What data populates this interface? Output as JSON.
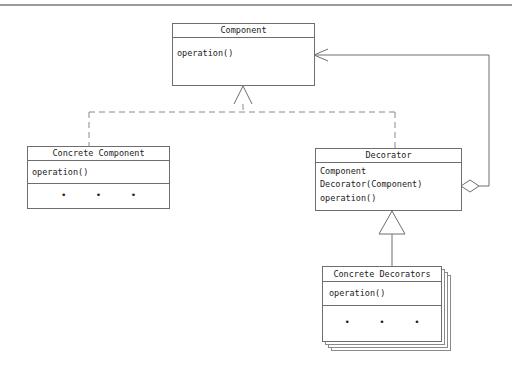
{
  "diagram": {
    "classes": {
      "component": {
        "name": "Component",
        "methods": [
          "operation()"
        ]
      },
      "concrete_component": {
        "name": "Concrete Component",
        "methods": [
          "operation()"
        ],
        "more": "• • •"
      },
      "decorator": {
        "name": "Decorator",
        "fields": [
          "Component"
        ],
        "methods": [
          "Decorator(Component)",
          "operation()"
        ]
      },
      "concrete_decorators": {
        "name": "Concrete Decorators",
        "methods": [
          "operation()"
        ],
        "more": "• • •",
        "stacked": true
      }
    },
    "relationships": [
      {
        "from": "Concrete Component",
        "to": "Component",
        "type": "realization (dashed, hollow triangle)"
      },
      {
        "from": "Decorator",
        "to": "Component",
        "type": "realization (dashed, hollow triangle)"
      },
      {
        "from": "Concrete Decorators",
        "to": "Decorator",
        "type": "inheritance (hollow triangle)"
      },
      {
        "from": "Decorator",
        "to": "Component",
        "type": "aggregation (hollow diamond, open arrow)"
      }
    ],
    "colors": {
      "line": "#6e6e6e",
      "dash": "#8a8a8a",
      "background": "#ffffff"
    }
  }
}
